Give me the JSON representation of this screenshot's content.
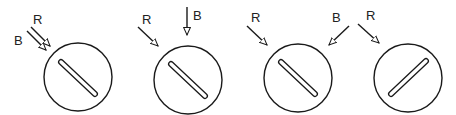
{
  "diagram": {
    "stroke_color": "#1a1a1a",
    "background": "#ffffff",
    "panels": [
      {
        "id": 1,
        "circle": {
          "cx": 78,
          "cy": 77,
          "r": 34
        },
        "slot": {
          "x1": 61,
          "y1": 62,
          "x2": 95,
          "y2": 94,
          "orientation": "backslash"
        },
        "arrows": [
          {
            "label": "R",
            "x1": 31,
            "y1": 27,
            "x2": 50,
            "y2": 46
          },
          {
            "label": "B",
            "x1": 27,
            "y1": 31,
            "x2": 46,
            "y2": 50
          }
        ],
        "labels": [
          {
            "text": "R",
            "x": 33,
            "y": 24
          },
          {
            "text": "B",
            "x": 14,
            "y": 45
          }
        ]
      },
      {
        "id": 2,
        "circle": {
          "cx": 188,
          "cy": 80,
          "r": 34
        },
        "slot": {
          "x1": 171,
          "y1": 64,
          "x2": 205,
          "y2": 96,
          "orientation": "backslash"
        },
        "arrows": [
          {
            "label": "R",
            "x1": 138,
            "y1": 27,
            "x2": 158,
            "y2": 46
          },
          {
            "label": "B",
            "x1": 187,
            "y1": 7,
            "x2": 187,
            "y2": 35
          }
        ],
        "labels": [
          {
            "text": "R",
            "x": 142,
            "y": 24
          },
          {
            "text": "B",
            "x": 193,
            "y": 20
          }
        ]
      },
      {
        "id": 3,
        "circle": {
          "cx": 298,
          "cy": 78,
          "r": 34
        },
        "slot": {
          "x1": 281,
          "y1": 62,
          "x2": 315,
          "y2": 94,
          "orientation": "backslash"
        },
        "arrows": [
          {
            "label": "R",
            "x1": 247,
            "y1": 26,
            "x2": 267,
            "y2": 45
          },
          {
            "label": "B",
            "x1": 349,
            "y1": 26,
            "x2": 329,
            "y2": 45
          }
        ],
        "labels": [
          {
            "text": "R",
            "x": 251,
            "y": 22
          },
          {
            "text": "B",
            "x": 332,
            "y": 22
          }
        ]
      },
      {
        "id": 4,
        "circle": {
          "cx": 408,
          "cy": 78,
          "r": 34
        },
        "slot": {
          "x1": 391,
          "y1": 94,
          "x2": 426,
          "y2": 61,
          "orientation": "slash"
        },
        "arrows": [
          {
            "label": "R",
            "x1": 358,
            "y1": 24,
            "x2": 379,
            "y2": 43
          }
        ],
        "labels": [
          {
            "text": "R",
            "x": 366,
            "y": 20
          }
        ]
      }
    ]
  }
}
